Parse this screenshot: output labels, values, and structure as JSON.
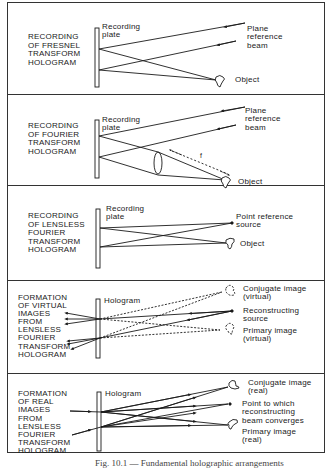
{
  "panels": [
    {
      "title": "RECORDING\nOF FRESNEL\nTRANSFORM\nHOLOGRAM",
      "plate_label": "Recording\nplate",
      "labels": {
        "reference": "Plane\nreference\nbeam",
        "object": "Object"
      }
    },
    {
      "title": "RECORDING\nOF FOURIER\nTRANSFORM\nHOLOGRAM",
      "plate_label": "Recording\nplate",
      "labels": {
        "reference": "Plane\nreference\nbeam",
        "object": "Object",
        "focal": "f"
      }
    },
    {
      "title": "RECORDING\nOF LENSLESS\nFOURIER\nTRANSFORM\nHOLOGRAM",
      "plate_label": "Recording\nplate",
      "labels": {
        "reference": "Point reference\nsource",
        "object": "Object"
      }
    },
    {
      "title": "FORMATION\nOF VIRTUAL\nIMAGES\nFROM\nLENSLESS\nFOURIER\nTRANSFORM\nHOLOGRAM",
      "plate_label": "Hologram",
      "labels": {
        "conjugate": "Conjugate image\n(virtual)",
        "source": "Reconstructing\nsource",
        "primary": "Primary image\n(virtual)"
      }
    },
    {
      "title": "FORMATION\nOF REAL\nIMAGES\nFROM\nLENSLESS\nFOURIER\nTRANSFORM\nHOLOGRAM",
      "plate_label": "Hologram",
      "labels": {
        "conjugate": "Conjugate image\n(real)",
        "converge": "Point to which\nreconstructing\nbeam converges",
        "primary": "Primary image\n(real)"
      }
    }
  ],
  "caption": "Fig. 10.1 — Fundamental holographic arrangements"
}
